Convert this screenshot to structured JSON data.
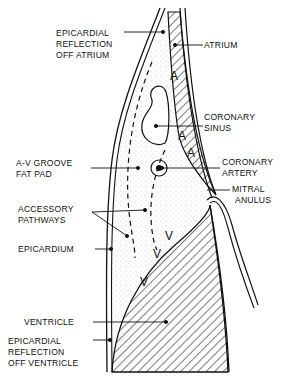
{
  "diagram": {
    "type": "anatomical cross-section",
    "labels": {
      "epicardial_reflection_atrium": [
        "EPICARDIAL",
        "REFLECTION",
        "OFF ATRIUM"
      ],
      "atrium": [
        "ATRIUM"
      ],
      "coronary_sinus": [
        "CORONARY",
        "SINUS"
      ],
      "av_groove_fat_pad": [
        "A-V GROOVE",
        "FAT PAD"
      ],
      "coronary_artery": [
        "CORONARY",
        "ARTERY"
      ],
      "mitral_anulus": [
        "MITRAL",
        "ANULUS"
      ],
      "accessory_pathways": [
        "ACCESSORY",
        "PATHWAYS"
      ],
      "epicardium": [
        "EPICARDIUM"
      ],
      "ventricle": [
        "VENTRICLE"
      ],
      "epicardial_reflection_ventricle": [
        "EPICARDIAL",
        "REFLECTION",
        "OFF VENTRICLE"
      ]
    },
    "region_marks": {
      "atrium": [
        "A",
        "A",
        "A"
      ],
      "ventricle": [
        "V",
        "V",
        "V"
      ]
    },
    "colors": {
      "ink": "#111111",
      "background": "#ffffff",
      "stipple": "#9a9a9a"
    }
  }
}
